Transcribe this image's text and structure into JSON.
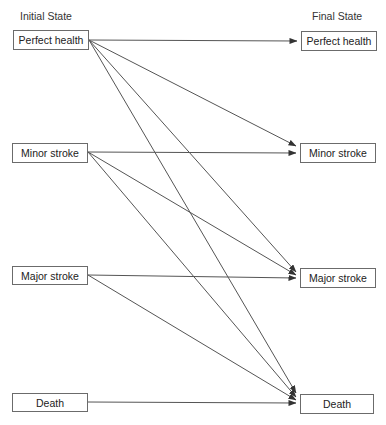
{
  "diagram": {
    "initial_header": "Initial State",
    "final_header": "Final State",
    "line_color": "#555555",
    "initial_states": [
      {
        "id": "ph",
        "label": "Perfect health",
        "x": 13,
        "y": 30,
        "w": 76,
        "h": 20
      },
      {
        "id": "mi",
        "label": "Minor stroke",
        "x": 12,
        "y": 143,
        "w": 76,
        "h": 20
      },
      {
        "id": "ma",
        "label": "Major stroke",
        "x": 12,
        "y": 266,
        "w": 76,
        "h": 19
      },
      {
        "id": "de",
        "label": "Death",
        "x": 12,
        "y": 393,
        "w": 76,
        "h": 19
      }
    ],
    "final_states": [
      {
        "id": "ph",
        "label": "Perfect health",
        "x": 301,
        "y": 31,
        "w": 76,
        "h": 20
      },
      {
        "id": "mi",
        "label": "Minor stroke",
        "x": 300,
        "y": 143,
        "w": 76,
        "h": 20
      },
      {
        "id": "ma",
        "label": "Major stroke",
        "x": 300,
        "y": 268,
        "w": 76,
        "h": 20
      },
      {
        "id": "de",
        "label": "Death",
        "x": 300,
        "y": 394,
        "w": 74,
        "h": 20
      }
    ],
    "transitions": [
      {
        "from": "Perfect health",
        "to": "Perfect health",
        "x1": 89,
        "y1": 40,
        "x2": 297,
        "y2": 41
      },
      {
        "from": "Perfect health",
        "to": "Minor stroke",
        "x1": 89,
        "y1": 40,
        "x2": 296,
        "y2": 146
      },
      {
        "from": "Perfect health",
        "to": "Major stroke",
        "x1": 89,
        "y1": 40,
        "x2": 296,
        "y2": 272
      },
      {
        "from": "Perfect health",
        "to": "Death",
        "x1": 89,
        "y1": 40,
        "x2": 296,
        "y2": 393
      },
      {
        "from": "Minor stroke",
        "to": "Minor stroke",
        "x1": 88,
        "y1": 152,
        "x2": 296,
        "y2": 153
      },
      {
        "from": "Minor stroke",
        "to": "Major stroke",
        "x1": 88,
        "y1": 152,
        "x2": 296,
        "y2": 275
      },
      {
        "from": "Minor stroke",
        "to": "Death",
        "x1": 88,
        "y1": 152,
        "x2": 296,
        "y2": 397
      },
      {
        "from": "Major stroke",
        "to": "Major stroke",
        "x1": 88,
        "y1": 275,
        "x2": 296,
        "y2": 278
      },
      {
        "from": "Major stroke",
        "to": "Death",
        "x1": 88,
        "y1": 275,
        "x2": 296,
        "y2": 400
      },
      {
        "from": "Death",
        "to": "Death",
        "x1": 88,
        "y1": 402,
        "x2": 296,
        "y2": 403
      }
    ]
  }
}
